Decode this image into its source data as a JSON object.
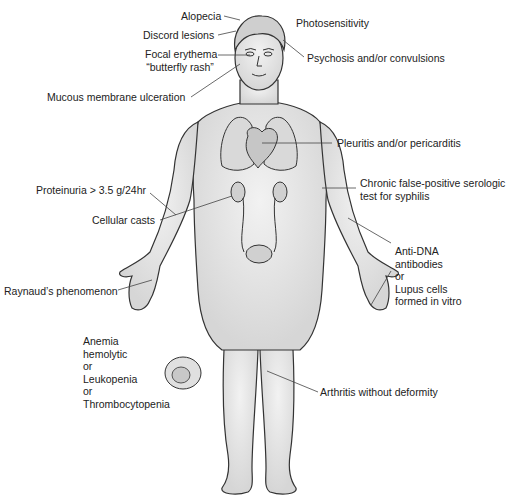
{
  "diagram": {
    "type": "anatomical-annotated-figure",
    "labels": {
      "alopecia": "Alopecia",
      "discord_lesions": "Discord lesions",
      "focal_erythema_line1": "Focal erythema",
      "focal_erythema_line2": "“butterfly rash”",
      "mucous_membrane": "Mucous membrane ulceration",
      "photosensitivity": "Photosensitivity",
      "psychosis": "Psychosis and/or convulsions",
      "pleuritis": "Pleuritis and/or pericarditis",
      "proteinuria": "Proteinuria > 3.5 g/24hr",
      "cellular_casts": "Cellular casts",
      "serologic_line1": "Chronic false-positive serologic",
      "serologic_line2": "test for syphilis",
      "anti_dna": "Anti-DNA\nantibodies\nor\nLupus cells\nformed in vitro",
      "raynaud": "Raynaud’s phenomenon",
      "blood": "Anemia\nhemolytic\nor\nLeukopenia\nor\nThrombocytopenia",
      "arthritis": "Arthritis without deformity"
    },
    "colors": {
      "skin": "#e4e4e4",
      "outline": "#333333",
      "text": "#222222",
      "leader": "#444444"
    }
  }
}
